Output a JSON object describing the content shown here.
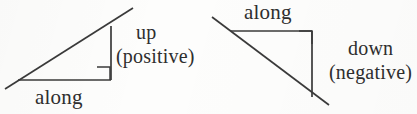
{
  "figure": {
    "kind": "geometry-diagram",
    "background_color": "#fdfdfc",
    "ink_color": "#3a3a3a",
    "panels": [
      {
        "id": "left",
        "meaning": "upward slope",
        "labels": {
          "base": "along",
          "rise_line1": "up",
          "rise_line2": "(positive)"
        },
        "geometry": {
          "hypotenuse": {
            "x1": 5,
            "y1": 89,
            "x2": 133,
            "y2": 8
          },
          "base": {
            "x1": 18,
            "y1": 80,
            "x2": 111,
            "y2": 80
          },
          "vertical": {
            "x1": 111,
            "y1": 26,
            "x2": 111,
            "y2": 80
          },
          "right_angle_marker": {
            "x": 97,
            "y": 67,
            "size": 13
          }
        }
      },
      {
        "id": "right",
        "meaning": "downward slope",
        "labels": {
          "base": "along",
          "fall_line1": "down",
          "fall_line2": "(negative)"
        },
        "geometry": {
          "hypotenuse": {
            "x1": 212,
            "y1": 17,
            "x2": 329,
            "y2": 105
          },
          "base": {
            "x1": 231,
            "y1": 31,
            "x2": 312,
            "y2": 31
          },
          "vertical": {
            "x1": 312,
            "y1": 31,
            "x2": 312,
            "y2": 97
          },
          "right_angle_marker": {
            "x": 299,
            "y": 31,
            "size": 13
          }
        }
      }
    ]
  }
}
